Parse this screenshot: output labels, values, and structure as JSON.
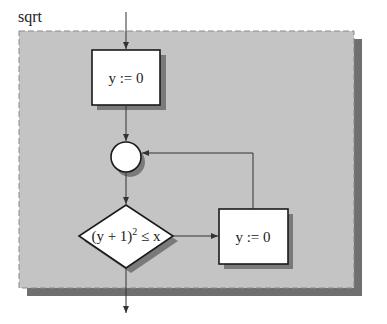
{
  "diagram": {
    "title": "sqrt",
    "colors": {
      "panel_fill": "#c4c4c4",
      "panel_border": "#8a8a8a",
      "panel_shadow": "#6f6f6f",
      "node_fill": "#ffffff",
      "node_stroke": "#1a1a1a",
      "node_shadow": "#7a7a7a",
      "edge": "#333333"
    },
    "nodes": [
      {
        "id": "init",
        "type": "process",
        "label": "y := 0"
      },
      {
        "id": "join",
        "type": "connector",
        "label": ""
      },
      {
        "id": "cond",
        "type": "decision",
        "label_main": "(y + 1)",
        "label_sup": "2",
        "label_rest": " ≤ x"
      },
      {
        "id": "body",
        "type": "process",
        "label": "y := 0"
      }
    ],
    "edges": [
      {
        "from": "entry",
        "to": "init"
      },
      {
        "from": "init",
        "to": "join"
      },
      {
        "from": "join",
        "to": "cond"
      },
      {
        "from": "cond",
        "to": "body"
      },
      {
        "from": "body",
        "to": "join"
      },
      {
        "from": "cond",
        "to": "exit"
      }
    ]
  }
}
